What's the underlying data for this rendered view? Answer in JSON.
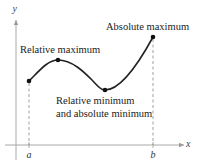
{
  "diagram": {
    "axes": {
      "x_label": "x",
      "y_label": "y"
    },
    "interval": {
      "left_label": "a",
      "right_label": "b"
    },
    "annotations": {
      "relative_maximum": "Relative maximum",
      "absolute_maximum": "Absolute maximum",
      "relative_minimum_line1": "Relative minimum",
      "relative_minimum_line2": "and absolute minimum"
    },
    "points": [
      {
        "name": "left-endpoint",
        "label": "a"
      },
      {
        "name": "relative-maximum",
        "label": "Relative maximum"
      },
      {
        "name": "relative-minimum",
        "label": "Relative minimum and absolute minimum"
      },
      {
        "name": "absolute-maximum",
        "label": "Absolute maximum"
      }
    ],
    "colors": {
      "curve": "#222222",
      "axis": "#999999",
      "dashed": "#888888"
    }
  }
}
